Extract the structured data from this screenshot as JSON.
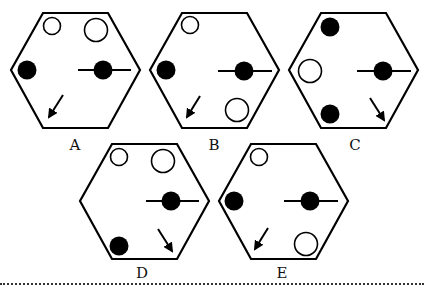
{
  "puzzle": {
    "type": "odd-one-out hexagon figures",
    "stroke_color": "#000000",
    "fill_color": "#000000",
    "background": "#ffffff",
    "options": [
      {
        "label": "A",
        "elements": [
          {
            "kind": "circle",
            "fill": "white",
            "position": "top-left",
            "size": "small"
          },
          {
            "kind": "circle",
            "fill": "white",
            "position": "top-right",
            "size": "large"
          },
          {
            "kind": "circle",
            "fill": "black",
            "position": "left",
            "size": "medium"
          },
          {
            "kind": "dot-on-line",
            "fill": "black",
            "position": "right"
          },
          {
            "kind": "arrow",
            "direction": "down-left",
            "position": "bottom-left"
          }
        ]
      },
      {
        "label": "B",
        "elements": [
          {
            "kind": "circle",
            "fill": "white",
            "position": "top-left",
            "size": "small"
          },
          {
            "kind": "circle",
            "fill": "black",
            "position": "left",
            "size": "medium"
          },
          {
            "kind": "dot-on-line",
            "fill": "black",
            "position": "right"
          },
          {
            "kind": "arrow",
            "direction": "down-left",
            "position": "bottom-left"
          },
          {
            "kind": "circle",
            "fill": "white",
            "position": "bottom-right",
            "size": "large"
          }
        ]
      },
      {
        "label": "C",
        "elements": [
          {
            "kind": "circle",
            "fill": "black",
            "position": "top-left",
            "size": "medium"
          },
          {
            "kind": "circle",
            "fill": "white",
            "position": "left",
            "size": "large"
          },
          {
            "kind": "dot-on-line",
            "fill": "black",
            "position": "right"
          },
          {
            "kind": "circle",
            "fill": "black",
            "position": "bottom-left",
            "size": "medium"
          },
          {
            "kind": "arrow",
            "direction": "down-right",
            "position": "bottom-right"
          }
        ]
      },
      {
        "label": "D",
        "elements": [
          {
            "kind": "circle",
            "fill": "white",
            "position": "top-left",
            "size": "small"
          },
          {
            "kind": "circle",
            "fill": "white",
            "position": "top-right",
            "size": "large"
          },
          {
            "kind": "dot-on-line",
            "fill": "black",
            "position": "right"
          },
          {
            "kind": "circle",
            "fill": "black",
            "position": "bottom-left",
            "size": "medium"
          },
          {
            "kind": "arrow",
            "direction": "down-right",
            "position": "bottom-right"
          }
        ]
      },
      {
        "label": "E",
        "elements": [
          {
            "kind": "circle",
            "fill": "white",
            "position": "top-left",
            "size": "small"
          },
          {
            "kind": "circle",
            "fill": "black",
            "position": "left",
            "size": "medium"
          },
          {
            "kind": "dot-on-line",
            "fill": "black",
            "position": "right"
          },
          {
            "kind": "arrow",
            "direction": "down-left",
            "position": "bottom-left"
          },
          {
            "kind": "circle",
            "fill": "white",
            "position": "bottom-right",
            "size": "large"
          }
        ]
      }
    ]
  }
}
